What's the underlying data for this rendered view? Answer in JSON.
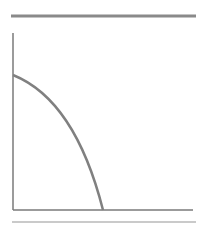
{
  "diagram": {
    "type": "quarter-ellipse-curve-on-axes",
    "colors": {
      "top_bar": "#8a8a8a",
      "axes": "#7a7a7a",
      "curve": "#808080",
      "bottom_rule": "#b8b8b8",
      "background": "#ffffff"
    },
    "top_bar": {
      "x1": 11,
      "x2": 196,
      "y": 16,
      "thickness": 3
    },
    "y_axis": {
      "x": 13,
      "y1": 33,
      "y2": 210
    },
    "x_axis": {
      "y": 210,
      "x1": 13,
      "x2": 193
    },
    "curve": {
      "start": [
        13,
        75
      ],
      "end": [
        103,
        210
      ]
    },
    "bottom_rule": {
      "x1": 12,
      "x2": 196,
      "y": 222
    }
  }
}
